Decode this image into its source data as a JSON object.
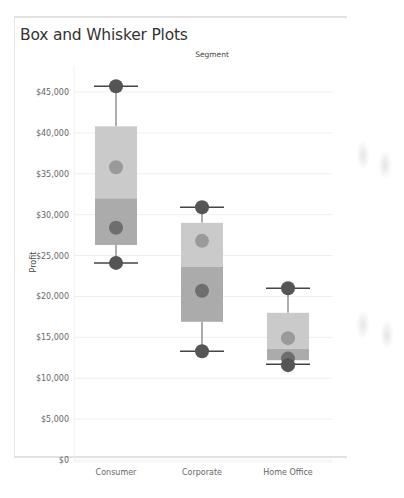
{
  "title": "Box and Whisker Plots",
  "chart_data": {
    "type": "box",
    "title": "Box and Whisker Plots",
    "column_header": "Segment",
    "xlabel": "",
    "ylabel": "Profit",
    "categories": [
      "Consumer",
      "Corporate",
      "Home Office"
    ],
    "ylim": [
      0,
      47000
    ],
    "yticks": [
      0,
      5000,
      10000,
      15000,
      20000,
      25000,
      30000,
      35000,
      40000,
      45000
    ],
    "ytick_labels": [
      "$0",
      "$5,000",
      "$10,000",
      "$15,000",
      "$20,000",
      "$25,000",
      "$30,000",
      "$35,000",
      "$40,000",
      "$45,000"
    ],
    "grid": true,
    "boxes": [
      {
        "category": "Consumer",
        "whisker_max": 45700,
        "q3": 40800,
        "median": 32000,
        "q1": 26300,
        "whisker_min": 24100,
        "points": [
          45700,
          35800,
          28400,
          24100
        ]
      },
      {
        "category": "Corporate",
        "whisker_max": 30900,
        "q3": 29000,
        "median": 23600,
        "q1": 16900,
        "whisker_min": 13300,
        "points": [
          30900,
          26800,
          20700,
          13300
        ]
      },
      {
        "category": "Home Office",
        "whisker_max": 21000,
        "q3": 18000,
        "median": 13600,
        "q1": 12200,
        "whisker_min": 11700,
        "points": [
          21000,
          14900,
          12400,
          11600
        ]
      }
    ],
    "colors": {
      "upper_box": "#cacaca",
      "lower_box": "#ababab",
      "point_light": "#9a9a9a",
      "point_dark": "#6e6e6e",
      "whisker_point": "#555555",
      "whisker_line": "#777777",
      "grid": "#efefef"
    }
  }
}
